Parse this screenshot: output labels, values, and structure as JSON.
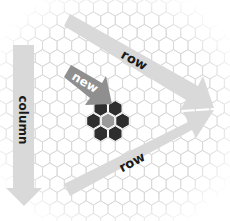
{
  "diagram": {
    "title": "",
    "grid": {
      "type": "hexagonal",
      "orientation": "pointy-top",
      "line_color": "#d6d6d6"
    },
    "cluster": {
      "center_color": "#9a9a9a",
      "ring_color": "#2e2e2e",
      "ring_count": 6
    },
    "arrows": [
      {
        "id": "row-top",
        "label": "row",
        "color": "#d9d9d9",
        "text_color": "#1a1a1a"
      },
      {
        "id": "new",
        "label": "new",
        "color": "#8f8f8f",
        "text_color": "#ffffff"
      },
      {
        "id": "column",
        "label": "column",
        "color": "#d9d9d9",
        "text_color": "#1a1a1a"
      },
      {
        "id": "row-bottom",
        "label": "row",
        "color": "#d9d9d9",
        "text_color": "#1a1a1a"
      }
    ]
  }
}
